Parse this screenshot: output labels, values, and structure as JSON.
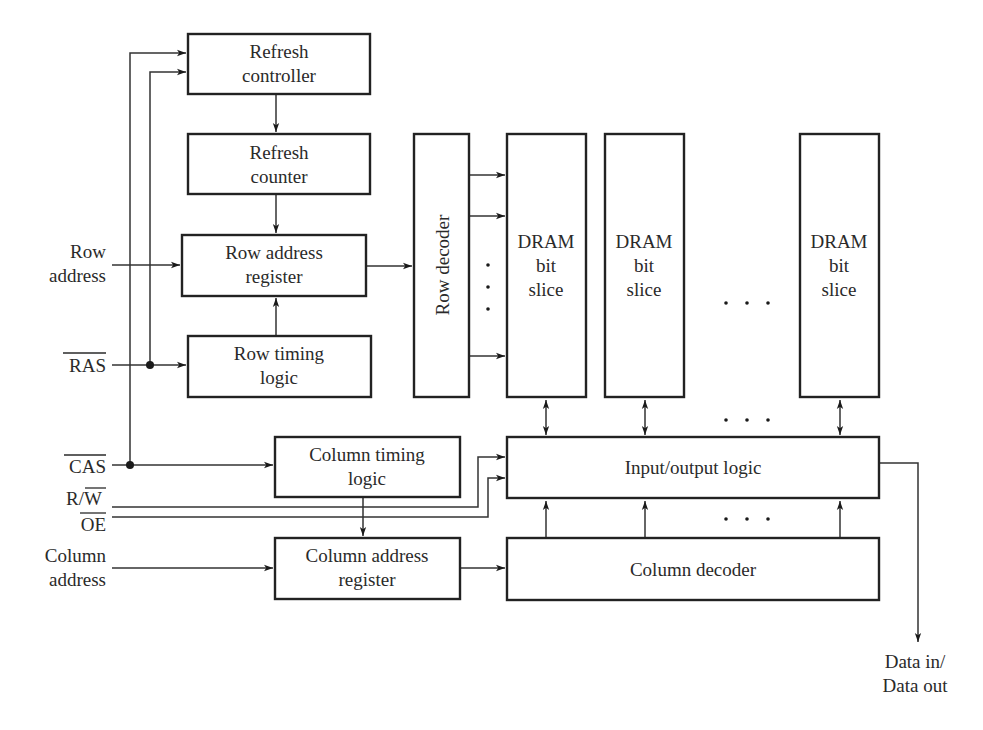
{
  "diagram": {
    "blocks": {
      "refresh_controller": [
        "Refresh",
        "controller"
      ],
      "refresh_counter": [
        "Refresh",
        "counter"
      ],
      "row_address_register": [
        "Row address",
        "register"
      ],
      "row_timing_logic": [
        "Row timing",
        "logic"
      ],
      "row_decoder": "Row decoder",
      "dram_slice": [
        "DRAM",
        "bit",
        "slice"
      ],
      "column_timing_logic": [
        "Column timing",
        "logic"
      ],
      "column_address_register": [
        "Column address",
        "register"
      ],
      "io_logic": "Input/output logic",
      "column_decoder": "Column decoder"
    },
    "signals": {
      "row_address": [
        "Row",
        "address"
      ],
      "ras": "RAS",
      "cas": "CAS",
      "rw_r": "R/",
      "rw_w": "W",
      "oe": "OE",
      "column_address": [
        "Column",
        "address"
      ],
      "data_io": [
        "Data in/",
        "Data out"
      ]
    },
    "ellipsis": "· · ·",
    "vertical_ellipsis": "·"
  }
}
